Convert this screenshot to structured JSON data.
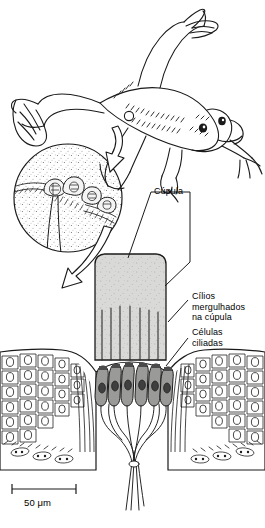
{
  "figure": {
    "organism": "swimming frog (dorsal view) with lateral line system"
  },
  "labels": {
    "cupula": "Cúpula",
    "cilia": "Cílios\nmergulhados\nna cúpula",
    "hair_cells": "Células\nciliadas"
  },
  "scale_bar": {
    "text": "50 μm",
    "length_px": 64
  },
  "colors": {
    "ink": "#1a1a1a",
    "cupula_fill": "#d9d9d7",
    "hair_cell_fill": "#9a9a98",
    "nucleus_fill": "#4a4a4a",
    "background": "#ffffff"
  },
  "structures": {
    "frog": "Xenopus-like frog, dorsolateral view, webbed hind feet",
    "callout_circle": "magnified patch of skin showing row of neuromast organs",
    "neuromast_count": 4,
    "cupula_shape": "rounded-top column",
    "cilia_count": 7,
    "hair_cell_count": 6,
    "epithelium": "polygonal cells with oval nuclei flanking central depression",
    "nerve_bundle": "afferent fibers converging below hair cells"
  }
}
